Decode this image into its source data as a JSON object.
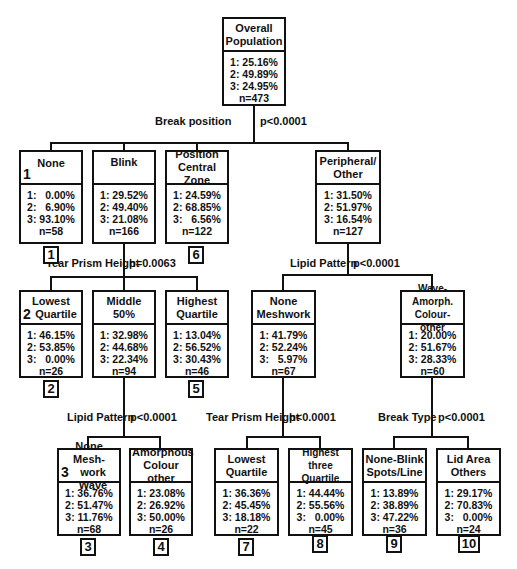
{
  "root": {
    "title_line1": "Overall",
    "title_line2": "Population",
    "s1": "1: 25.16%",
    "s2": "2: 49.89%",
    "s3": "3: 24.95%",
    "n": "n=473"
  },
  "splits": {
    "root": {
      "variable": "Break position",
      "p": "p<0.0001"
    },
    "blink": {
      "variable": "Tear Prism Height",
      "p": "p=0.0063"
    },
    "peripheral": {
      "variable": "Lipid Pattern",
      "p": "p<0.0001"
    },
    "middle": {
      "variable": "Lipid Pattern",
      "p": "p<0.0001"
    },
    "none_meshwork": {
      "variable": "Tear Prism Height",
      "p": "p<0.0001"
    },
    "wave_amorph": {
      "variable": "Break Type",
      "p": "p<0.0001"
    }
  },
  "level1": [
    {
      "title_line1": "None",
      "title_line2": "",
      "node_num": "1",
      "s1": "1:   0.00%",
      "s2": "2:   6.90%",
      "s3": "3: 93.10%",
      "n": "n=58",
      "leaf": "1"
    },
    {
      "title_line1": "Blink",
      "title_line2": "",
      "node_num": "",
      "s1": "1: 29.52%",
      "s2": "2: 49.40%",
      "s3": "3: 21.08%",
      "n": "n=166",
      "leaf": ""
    },
    {
      "title_line1": "Position",
      "title_line2": "Central Zone",
      "node_num": "",
      "s1": "1: 24.59%",
      "s2": "2: 68.85%",
      "s3": "3:   6.56%",
      "n": "n=122",
      "leaf": "6"
    },
    {
      "title_line1": "Peripheral/",
      "title_line2": "Other",
      "node_num": "",
      "s1": "1: 31.50%",
      "s2": "2: 51.97%",
      "s3": "3: 16.54%",
      "n": "n=127",
      "leaf": ""
    }
  ],
  "level2": [
    {
      "title_line1": "Lowest",
      "title_line2": "Quartile",
      "node_num": "2",
      "s1": "1: 46.15%",
      "s2": "2: 53.85%",
      "s3": "3:   0.00%",
      "n": "n=26",
      "leaf": "2"
    },
    {
      "title_line1": "Middle",
      "title_line2": "50%",
      "node_num": "",
      "s1": "1: 32.98%",
      "s2": "2: 44.68%",
      "s3": "3: 22.34%",
      "n": "n=94",
      "leaf": ""
    },
    {
      "title_line1": "Highest",
      "title_line2": "Quartile",
      "node_num": "",
      "s1": "1: 13.04%",
      "s2": "2: 56.52%",
      "s3": "3: 30.43%",
      "n": "n=46",
      "leaf": "5"
    },
    {
      "title_line1": "None",
      "title_line2": "Meshwork",
      "node_num": "",
      "s1": "1: 41.79%",
      "s2": "2: 52.24%",
      "s3": "3:   5.97%",
      "n": "n=67",
      "leaf": ""
    },
    {
      "title_line1": "Wave-Amorph.",
      "title_line2": "Colour-other",
      "node_num": "",
      "s1": "1: 20.00%",
      "s2": "2: 51.67%",
      "s3": "3: 28.33%",
      "n": "n=60",
      "leaf": ""
    }
  ],
  "level3": [
    {
      "title_line1": "None Mesh-",
      "title_line2": "work Wave",
      "node_num": "3",
      "s1": "1: 36.76%",
      "s2": "2: 51.47%",
      "s3": "3: 11.76%",
      "n": "n=68",
      "leaf": "3"
    },
    {
      "title_line1": "Amorphous",
      "title_line2": "Colour other",
      "node_num": "",
      "s1": "1: 23.08%",
      "s2": "2: 26.92%",
      "s3": "3: 50.00%",
      "n": "n=26",
      "leaf": "4"
    },
    {
      "title_line1": "Lowest",
      "title_line2": "Quartile",
      "node_num": "",
      "s1": "1: 36.36%",
      "s2": "2: 45.45%",
      "s3": "3: 18.18%",
      "n": "n=22",
      "leaf": "7"
    },
    {
      "title_line1": "Highest three",
      "title_line2": "Quartile",
      "node_num": "",
      "s1": "1: 44.44%",
      "s2": "2: 55.56%",
      "s3": "3:   0.00%",
      "n": "n=45",
      "leaf": "8"
    },
    {
      "title_line1": "None-Blink",
      "title_line2": "Spots/Line",
      "node_num": "",
      "s1": "1: 13.89%",
      "s2": "2: 38.89%",
      "s3": "3: 47.22%",
      "n": "n=36",
      "leaf": "9"
    },
    {
      "title_line1": "Lid Area",
      "title_line2": "Others",
      "node_num": "",
      "s1": "1: 29.17%",
      "s2": "2: 70.83%",
      "s3": "3:   0.00%",
      "n": "n=24",
      "leaf": "10"
    }
  ]
}
